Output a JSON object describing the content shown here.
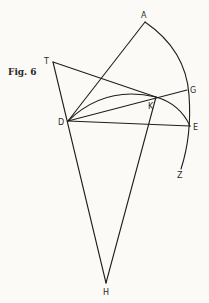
{
  "figure": {
    "caption": "Fig. 6",
    "points": {
      "A": {
        "label": "A",
        "x": 145,
        "y": 22
      },
      "T": {
        "label": "T",
        "x": 53,
        "y": 62
      },
      "D": {
        "label": "D",
        "x": 68,
        "y": 121
      },
      "K": {
        "label": "K",
        "x": 156,
        "y": 97
      },
      "G": {
        "label": "G",
        "x": 187,
        "y": 90
      },
      "E": {
        "label": "E",
        "x": 190,
        "y": 126
      },
      "Z": {
        "label": "Z",
        "x": 181,
        "y": 169
      },
      "H": {
        "label": "H",
        "x": 106,
        "y": 283
      }
    },
    "segments": [
      "DA",
      "TK",
      "DG",
      "DE",
      "TH",
      "KH"
    ],
    "arcs": [
      "A-G-E-Z (outer arc)",
      "D-K-E (inner arc)"
    ]
  }
}
